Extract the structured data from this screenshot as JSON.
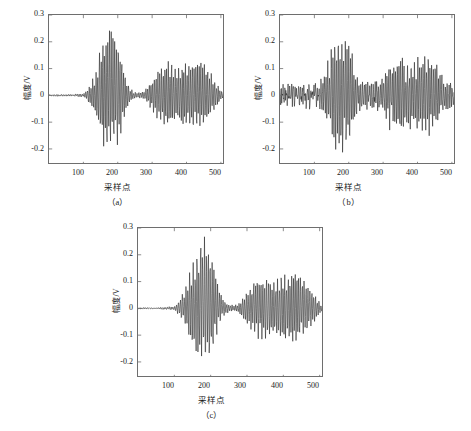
{
  "figure": {
    "background_color": "#ffffff",
    "line_color": "#1a1a1a",
    "axis_color": "#6e6e6e"
  },
  "panels": [
    {
      "id": "a",
      "caption": "（a）",
      "xlabel": "采样点",
      "ylabel": "幅度/V"
    },
    {
      "id": "b",
      "caption": "（b）",
      "xlabel": "采样点",
      "ylabel": "幅度/V"
    },
    {
      "id": "c",
      "caption": "（c）",
      "xlabel": "采样点",
      "ylabel": "幅度/V"
    }
  ],
  "chart_data": [
    {
      "type": "line",
      "id": "a",
      "title": "",
      "caption": "（a）",
      "xlabel": "采样点",
      "ylabel": "幅度/V",
      "xlim": [
        0,
        512
      ],
      "ylim": [
        -0.26,
        0.3
      ],
      "xticks": [
        100,
        200,
        300,
        400,
        500
      ],
      "yticks": [
        0.3,
        0.2,
        0.1,
        0,
        -0.1,
        -0.2
      ],
      "xticklabels": [
        "100",
        "200",
        "300",
        "400",
        "500"
      ],
      "yticklabels": [
        "0.3",
        "0.2",
        "0.1",
        "0",
        "-0.1",
        "-0.2"
      ],
      "grid": false,
      "legend": null,
      "description": "Clean de-noised acoustic emission signal: flat baseline until sample ~105, first high-amplitude wave packet from ~115 to ~235 peaking at +0.26 and -0.21, quiet interval ~235-285, second dense wave packet ~285-512 with envelope peaking near +-0.13.",
      "envelope": {
        "x": [
          0,
          60,
          100,
          112,
          125,
          140,
          152,
          165,
          178,
          190,
          202,
          215,
          228,
          238,
          250,
          262,
          275,
          288,
          300,
          315,
          330,
          345,
          358,
          370,
          382,
          395,
          408,
          420,
          432,
          445,
          458,
          470,
          482,
          495,
          505,
          512
        ],
        "upper": [
          0.002,
          0.003,
          0.006,
          0.022,
          0.055,
          0.105,
          0.175,
          0.215,
          0.262,
          0.232,
          0.205,
          0.118,
          0.052,
          0.024,
          0.012,
          0.01,
          0.014,
          0.035,
          0.062,
          0.092,
          0.112,
          0.126,
          0.118,
          0.1,
          0.108,
          0.122,
          0.114,
          0.128,
          0.132,
          0.125,
          0.106,
          0.084,
          0.058,
          0.03,
          0.012,
          0.004
        ],
        "lower": [
          -0.002,
          -0.003,
          -0.006,
          -0.02,
          -0.05,
          -0.098,
          -0.16,
          -0.2,
          -0.212,
          -0.19,
          -0.188,
          -0.106,
          -0.048,
          -0.022,
          -0.011,
          -0.009,
          -0.013,
          -0.033,
          -0.058,
          -0.088,
          -0.108,
          -0.122,
          -0.114,
          -0.096,
          -0.104,
          -0.118,
          -0.11,
          -0.124,
          -0.128,
          -0.12,
          -0.102,
          -0.08,
          -0.055,
          -0.028,
          -0.011,
          -0.004
        ]
      },
      "noise_floor": 0.0015,
      "carrier_period": 5.0
    },
    {
      "type": "line",
      "id": "b",
      "title": "",
      "caption": "（b）",
      "xlabel": "采样点",
      "ylabel": "幅度/V",
      "xlim": [
        0,
        512
      ],
      "ylim": [
        -0.26,
        0.3
      ],
      "xticks": [
        100,
        200,
        300,
        400,
        500
      ],
      "yticks": [
        0.3,
        0.2,
        0.1,
        0,
        -0.1,
        -0.2
      ],
      "xticklabels": [
        "100",
        "200",
        "300",
        "400",
        "500"
      ],
      "yticklabels": [
        "0.3",
        "0.2",
        "0.1",
        "0",
        "-0.1",
        "-0.2"
      ],
      "grid": false,
      "legend": null,
      "description": "Noisy raw acoustic emission signal: broadband random noise of about +-0.03 spans the whole record; first wave packet ~120-230 peaks at +0.23 and -0.22, second packet ~290-470 peaks near +-0.16.",
      "envelope": {
        "x": [
          0,
          60,
          100,
          112,
          125,
          140,
          152,
          165,
          178,
          190,
          202,
          215,
          228,
          238,
          250,
          262,
          275,
          288,
          300,
          315,
          330,
          345,
          358,
          370,
          382,
          395,
          408,
          420,
          432,
          445,
          458,
          470,
          482,
          495,
          505,
          512
        ],
        "upper": [
          0.03,
          0.032,
          0.034,
          0.04,
          0.062,
          0.108,
          0.17,
          0.205,
          0.228,
          0.21,
          0.196,
          0.118,
          0.06,
          0.04,
          0.034,
          0.033,
          0.038,
          0.052,
          0.072,
          0.098,
          0.116,
          0.13,
          0.158,
          0.112,
          0.118,
          0.13,
          0.122,
          0.138,
          0.142,
          0.13,
          0.112,
          0.09,
          0.062,
          0.042,
          0.034,
          0.03
        ],
        "lower": [
          -0.03,
          -0.032,
          -0.034,
          -0.038,
          -0.058,
          -0.1,
          -0.162,
          -0.196,
          -0.22,
          -0.2,
          -0.19,
          -0.112,
          -0.056,
          -0.038,
          -0.033,
          -0.032,
          -0.036,
          -0.05,
          -0.068,
          -0.094,
          -0.112,
          -0.126,
          -0.15,
          -0.108,
          -0.114,
          -0.126,
          -0.118,
          -0.134,
          -0.138,
          -0.126,
          -0.108,
          -0.088,
          -0.06,
          -0.04,
          -0.033,
          -0.03
        ]
      },
      "noise_floor": 0.028,
      "carrier_period": 5.0
    },
    {
      "type": "line",
      "id": "c",
      "title": "",
      "caption": "（c）",
      "xlabel": "采样点",
      "ylabel": "幅度/V",
      "xlim": [
        0,
        512
      ],
      "ylim": [
        -0.26,
        0.3
      ],
      "xticks": [
        100,
        200,
        300,
        400,
        500
      ],
      "yticks": [
        0.3,
        0.2,
        0.1,
        0,
        -0.1,
        -0.2
      ],
      "xticklabels": [
        "100",
        "200",
        "300",
        "400",
        "500"
      ],
      "yticklabels": [
        "0.3",
        "0.2",
        "0.1",
        "0",
        "-0.1",
        "-0.2"
      ],
      "grid": false,
      "legend": null,
      "description": "Reconstructed signal after de-noising: flat baseline to sample ~105, first wave packet ~115-235 peaking at +0.27 and -0.20, low-level interval ~235-285, second packet ~285-512 with envelope near +-0.14.",
      "envelope": {
        "x": [
          0,
          60,
          100,
          112,
          125,
          140,
          152,
          165,
          178,
          190,
          202,
          215,
          228,
          238,
          250,
          262,
          275,
          288,
          300,
          315,
          330,
          345,
          358,
          370,
          382,
          395,
          408,
          420,
          432,
          445,
          458,
          470,
          482,
          495,
          505,
          512
        ],
        "upper": [
          0.002,
          0.003,
          0.007,
          0.026,
          0.06,
          0.112,
          0.182,
          0.218,
          0.268,
          0.236,
          0.208,
          0.122,
          0.056,
          0.026,
          0.014,
          0.012,
          0.016,
          0.038,
          0.066,
          0.096,
          0.118,
          0.132,
          0.12,
          0.102,
          0.11,
          0.126,
          0.118,
          0.132,
          0.14,
          0.128,
          0.108,
          0.086,
          0.06,
          0.032,
          0.014,
          0.004
        ],
        "lower": [
          -0.002,
          -0.003,
          -0.007,
          -0.024,
          -0.054,
          -0.102,
          -0.166,
          -0.198,
          -0.196,
          -0.186,
          -0.184,
          -0.108,
          -0.05,
          -0.024,
          -0.012,
          -0.01,
          -0.015,
          -0.036,
          -0.062,
          -0.092,
          -0.112,
          -0.126,
          -0.116,
          -0.098,
          -0.106,
          -0.12,
          -0.114,
          -0.128,
          -0.134,
          -0.124,
          -0.104,
          -0.082,
          -0.058,
          -0.03,
          -0.013,
          -0.004
        ]
      },
      "noise_floor": 0.0015,
      "carrier_period": 5.0
    }
  ]
}
